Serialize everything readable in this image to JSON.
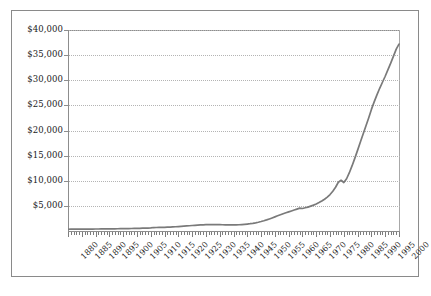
{
  "chart_data": {
    "type": "line",
    "title": "",
    "subtitle": "",
    "xlabel": "",
    "ylabel": "",
    "xlim": [
      1880,
      2000
    ],
    "ylim": [
      0,
      40000
    ],
    "grid": true,
    "legend": null,
    "line_color": "#7a7a7a",
    "gridline_color": "#b4b4b4",
    "axis_color": "#8d8d8d",
    "y_ticks": [
      0,
      5000,
      10000,
      15000,
      20000,
      25000,
      30000,
      35000,
      40000
    ],
    "y_tick_labels": [
      "",
      "$5,000",
      "$10,000",
      "$15,000",
      "$20,000",
      "$25,000",
      "$30,000",
      "$35,000",
      "$40,000"
    ],
    "x_ticks_major": [
      1880,
      1885,
      1890,
      1895,
      1900,
      1905,
      1910,
      1915,
      1920,
      1925,
      1930,
      1935,
      1940,
      1945,
      1950,
      1955,
      1960,
      1965,
      1970,
      1975,
      1980,
      1985,
      1990,
      1995,
      2000
    ],
    "x_tick_labels": [
      "1880",
      "1885",
      "1890",
      "1895",
      "1900",
      "1905",
      "1910",
      "1915",
      "1920",
      "1925",
      "1930",
      "1935",
      "1940",
      "1945",
      "1950",
      "1955",
      "1960",
      "1965",
      "1970",
      "1975",
      "1980",
      "1985",
      "1990",
      "1995",
      "2000"
    ],
    "x_tick_interval_minor": 1,
    "series": [
      {
        "name": "value",
        "x": [
          1880,
          1881,
          1882,
          1883,
          1884,
          1885,
          1886,
          1887,
          1888,
          1889,
          1890,
          1891,
          1892,
          1893,
          1894,
          1895,
          1896,
          1897,
          1898,
          1899,
          1900,
          1901,
          1902,
          1903,
          1904,
          1905,
          1906,
          1907,
          1908,
          1909,
          1910,
          1911,
          1912,
          1913,
          1914,
          1915,
          1916,
          1917,
          1918,
          1919,
          1920,
          1921,
          1922,
          1923,
          1924,
          1925,
          1926,
          1927,
          1928,
          1929,
          1930,
          1931,
          1932,
          1933,
          1934,
          1935,
          1936,
          1937,
          1938,
          1939,
          1940,
          1941,
          1942,
          1943,
          1944,
          1945,
          1946,
          1947,
          1948,
          1949,
          1950,
          1951,
          1952,
          1953,
          1954,
          1955,
          1956,
          1957,
          1958,
          1959,
          1960,
          1961,
          1962,
          1963,
          1964,
          1965,
          1966,
          1967,
          1968,
          1969,
          1970,
          1971,
          1972,
          1973,
          1974,
          1975,
          1976,
          1977,
          1978,
          1979,
          1980,
          1981,
          1982,
          1983,
          1984,
          1985,
          1986,
          1987,
          1988,
          1989,
          1990,
          1991,
          1992,
          1993,
          1994,
          1995,
          1996,
          1997,
          1998,
          1999,
          2000
        ],
        "y": [
          350,
          355,
          360,
          362,
          368,
          372,
          375,
          380,
          385,
          390,
          395,
          400,
          405,
          412,
          418,
          425,
          432,
          440,
          448,
          458,
          468,
          478,
          488,
          500,
          512,
          525,
          540,
          555,
          570,
          588,
          605,
          690,
          700,
          712,
          725,
          740,
          760,
          785,
          815,
          845,
          880,
          915,
          955,
          1000,
          1045,
          1090,
          1130,
          1165,
          1200,
          1230,
          1255,
          1270,
          1278,
          1280,
          1272,
          1260,
          1248,
          1238,
          1230,
          1222,
          1215,
          1225,
          1248,
          1285,
          1330,
          1385,
          1450,
          1530,
          1625,
          1740,
          1880,
          2035,
          2210,
          2400,
          2600,
          2810,
          3020,
          3230,
          3430,
          3620,
          3810,
          3990,
          4170,
          4360,
          4560,
          4480,
          4620,
          4760,
          4950,
          5150,
          5380,
          5650,
          5960,
          6320,
          6750,
          7250,
          7900,
          8700,
          9700,
          10100,
          9650,
          10400,
          11600,
          13000,
          14500,
          16100,
          17700,
          19300,
          20900,
          22500,
          24200,
          25700,
          27100,
          28400,
          29600,
          30800,
          32100,
          33400,
          34800,
          36200,
          37200
        ]
      }
    ]
  }
}
